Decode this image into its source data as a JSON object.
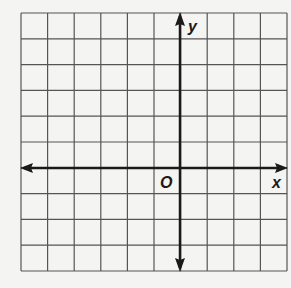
{
  "diagram": {
    "type": "coordinate-plane",
    "grid": {
      "columns": 10,
      "rows": 10,
      "left": 21,
      "top": 13,
      "right": 287,
      "bottom": 271,
      "line_color": "#555555"
    },
    "axes": {
      "x_label": "x",
      "y_label": "y",
      "origin_label": "O",
      "x_axis_row": 6,
      "y_axis_col": 6,
      "axis_color": "#1a1a1a",
      "x_arrows": "both",
      "y_arrows": "both"
    }
  }
}
